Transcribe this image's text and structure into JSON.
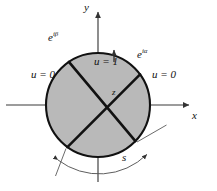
{
  "figure": {
    "type": "math-diagram",
    "axes": {
      "y_label": "y",
      "x_label": "x"
    },
    "boundary_points": [
      {
        "name": "e-i-beta",
        "label_base": "e",
        "label_exp": "iβ",
        "angle_deg": 124
      },
      {
        "name": "e-i-alpha",
        "label_base": "e",
        "label_exp": "iα",
        "angle_deg": 36
      }
    ],
    "regions": [
      {
        "name": "top-wedge",
        "label": "u = 1"
      },
      {
        "name": "left-wedge",
        "label": "u = 0"
      },
      {
        "name": "right-wedge",
        "label": "u = 0"
      }
    ],
    "point_z_label": "z",
    "arc_label": "s",
    "colors": {
      "disk_fill": "#b9b9b9",
      "disk_stroke": "#111111",
      "chord_stroke": "#111111",
      "axis_stroke": "#444444",
      "arc_stroke": "#555555",
      "text": "#111111"
    },
    "geometry": {
      "center_x": 98,
      "center_y": 105,
      "radius": 52,
      "chord1_deg": [
        124,
        -44
      ],
      "chord2_deg": [
        36,
        -126
      ],
      "arc_s_radius": 68,
      "arc_s_deg": [
        -126,
        -44
      ]
    }
  }
}
